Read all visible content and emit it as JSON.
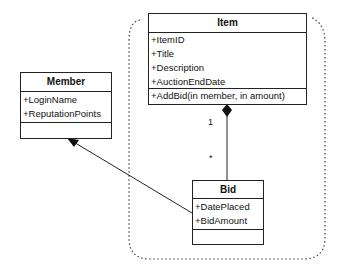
{
  "classes": {
    "item": {
      "name": "Item",
      "attributes": [
        "+ItemID",
        "+Title",
        "+Description",
        "+AuctionEndDate"
      ],
      "methods": [
        "+AddBid(in member, in amount)"
      ]
    },
    "member": {
      "name": "Member",
      "attributes": [
        "+LoginName",
        "+ReputationPoints"
      ],
      "methods": []
    },
    "bid": {
      "name": "Bid",
      "attributes": [
        "+DatePlaced",
        "+BidAmount"
      ],
      "methods": []
    }
  },
  "relationships": [
    {
      "type": "composition",
      "from": "Item",
      "to": "Bid",
      "from_multiplicity": "1",
      "to_multiplicity": "*"
    },
    {
      "type": "association",
      "from": "Bid",
      "to": "Member"
    }
  ],
  "labels": {
    "item_multiplicity": "1",
    "bid_multiplicity": "*"
  }
}
